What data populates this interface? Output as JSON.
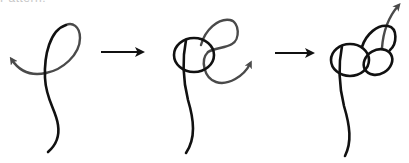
{
  "caption": {
    "text": "Pattern:",
    "note": "cropped at top edge"
  },
  "colors": {
    "background": "#ffffff",
    "working_strand": "#111111",
    "active_end": "#4a4a4a",
    "arrow": "#111111"
  },
  "steps": [
    {
      "index": 1,
      "label": "Step 1: form a loop, bring working end across",
      "icons": [
        "strand",
        "direction-arrow"
      ]
    },
    {
      "index": 2,
      "label": "Step 2: make a second loop through the first",
      "icons": [
        "strand",
        "direction-arrow"
      ]
    },
    {
      "index": 3,
      "label": "Step 3: thread the end up through to finish the knot",
      "icons": [
        "strand",
        "direction-arrow"
      ]
    }
  ],
  "transitions": [
    {
      "from": 1,
      "to": 2,
      "icon": "right-arrow"
    },
    {
      "from": 2,
      "to": 3,
      "icon": "right-arrow"
    }
  ]
}
